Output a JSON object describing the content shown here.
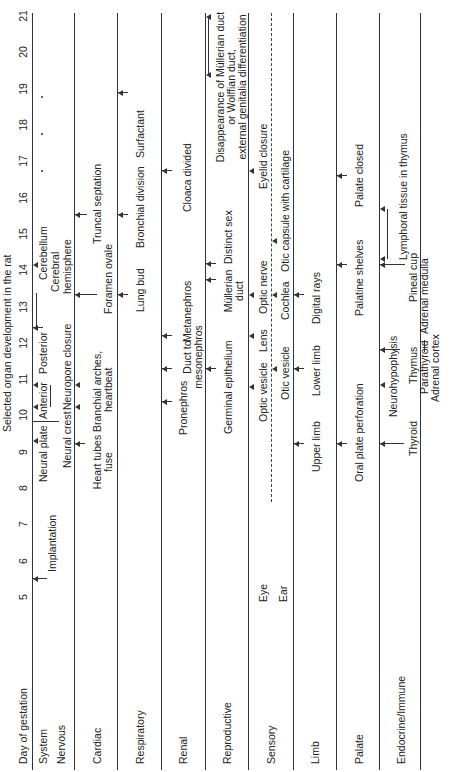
{
  "title": "Selected organ development in the rat",
  "axis": {
    "label": "Day of gestation",
    "days": [
      "5",
      "6",
      "7",
      "8",
      "9",
      "10",
      "11",
      "12",
      "13",
      "14",
      "15",
      "16",
      "17",
      "18",
      "19",
      "20",
      "21"
    ]
  },
  "column_header": "System",
  "rows": [
    {
      "name": "Nervous",
      "events": [
        "Implantation",
        "Neural plate",
        "Neural crest",
        "Anterior",
        "Posterior",
        "Neuropore closure",
        "Cerebral",
        "hemisphere",
        "Cerebellum"
      ]
    },
    {
      "name": "Cardiac",
      "events": [
        "Heart tubes",
        "fuse",
        "Branchial arches,",
        "heartbeat",
        "Foramen ovale",
        "Truncal septation"
      ]
    },
    {
      "name": "Respiratory",
      "events": [
        "Lung bud",
        "Bronchial division",
        "Surfactant"
      ]
    },
    {
      "name": "Renal",
      "events": [
        "Pronephros",
        "Duct to",
        "mesonephros",
        "Metanephros",
        "Cloaca divided"
      ]
    },
    {
      "name": "Reproductive",
      "events": [
        "Germinal epithelium",
        "Müllerian",
        "duct",
        "Distinct sex",
        "Disappearance of Müllerian duct",
        "or Wolffian duct,",
        "external genitalia differentiation"
      ]
    },
    {
      "name": "Sensory",
      "sub": [
        "Eye",
        "Ear"
      ],
      "events": [
        "Optic vesicle",
        "Lens",
        "Optic nerve",
        "Eyelid closure",
        "Otic vesicle",
        "Cochlea",
        "Otic capsule with cartilage"
      ]
    },
    {
      "name": "Limb",
      "events": [
        "Upper limb",
        "Lower limb",
        "Digital rays"
      ]
    },
    {
      "name": "Palate",
      "events": [
        "Oral plate perforation",
        "Palatine shelves",
        "Palate closed"
      ]
    },
    {
      "name": "Endocrine/Immune",
      "events": [
        "Thyroid",
        "Neurohypophysis",
        "Thymus",
        "Parathyroid",
        "Adrenal cortex",
        "Pineal cup",
        "Adrenal medulla",
        "Lymphoral tissue in thymus"
      ]
    }
  ]
}
